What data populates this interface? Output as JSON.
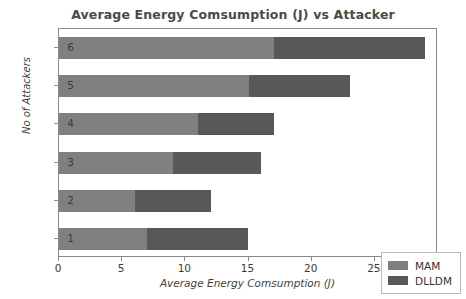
{
  "chart_data": {
    "type": "bar",
    "orientation": "horizontal",
    "stacked": true,
    "title": "Average Energy Comsumption (J) vs Attacker",
    "xlabel": "Average Energy Comsumption (J)",
    "ylabel": "No of Attackers",
    "categories": [
      "1",
      "2",
      "3",
      "4",
      "5",
      "6"
    ],
    "series": [
      {
        "name": "MAM",
        "color": "#808080",
        "values": [
          7,
          6,
          9,
          11,
          15,
          17
        ]
      },
      {
        "name": "DLLDM",
        "color": "#585858",
        "values": [
          8,
          6,
          7,
          6,
          8,
          12
        ]
      }
    ],
    "totals": [
      15,
      12,
      16,
      17,
      23,
      29
    ],
    "xlim": [
      0,
      30
    ],
    "xticks": [
      "0",
      "5",
      "10",
      "15",
      "20",
      "25",
      "30"
    ],
    "yticks": [
      "1",
      "2",
      "3",
      "4",
      "5",
      "6"
    ],
    "grid": false,
    "legend_position": "lower right"
  },
  "legend": {
    "entries": [
      {
        "label": "MAM"
      },
      {
        "label": "DLLDM"
      }
    ]
  }
}
